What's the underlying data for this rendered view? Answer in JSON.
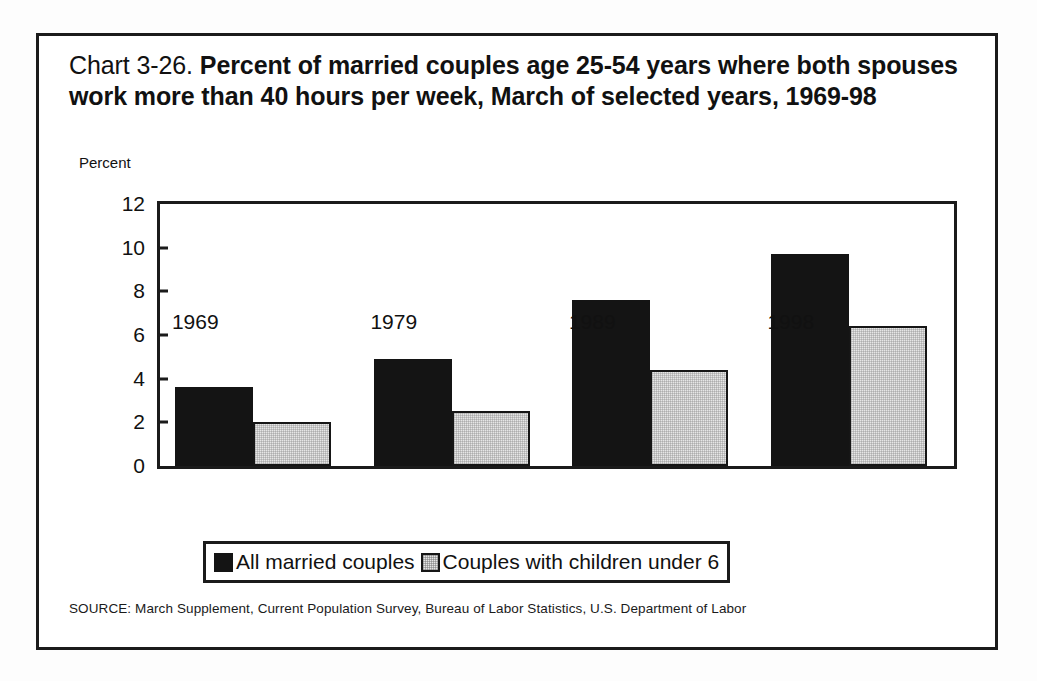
{
  "figure": {
    "title_number": "Chart 3-26.",
    "title_text": "Percent of married couples age 25-54 years where both spouses work more than 40 hours per week, March of selected years, 1969-98",
    "source_note": "SOURCE: March Supplement, Current  Population Survey, Bureau of Labor Statistics, U.S. Department of Labor",
    "colors": {
      "series_dark": "#141414",
      "series_light": "#e6e6e6",
      "frame": "#1b1b1b",
      "background": "#ffffff"
    }
  },
  "chart_data": {
    "type": "bar",
    "title": "Chart 3-26. Percent of married couples age 25-54 years where both spouses work more than 40 hours per week, March of selected years, 1969-98",
    "xlabel": "",
    "ylabel": "Percent",
    "categories": [
      "1969",
      "1979",
      "1989",
      "1998"
    ],
    "series": [
      {
        "name": "All married couples",
        "values": [
          3.6,
          4.9,
          7.6,
          9.7
        ],
        "color": "#141414"
      },
      {
        "name": "Couples with children under 6",
        "values": [
          2.0,
          2.5,
          4.4,
          6.4
        ],
        "color": "#e6e6e6"
      }
    ],
    "ylim": [
      0,
      12
    ],
    "yticks": [
      0,
      2,
      4,
      6,
      8,
      10,
      12
    ],
    "ytick_labels": [
      "0",
      "2",
      "4",
      "6",
      "8",
      "10",
      "12"
    ],
    "grid": false,
    "legend_position": "bottom"
  }
}
